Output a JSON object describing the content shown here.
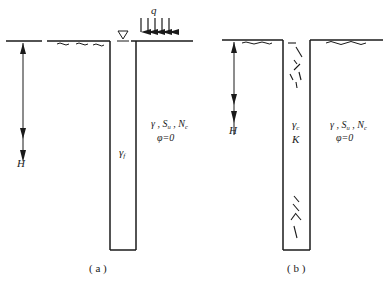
{
  "figure_a": {
    "caption": "( a )",
    "load_label": "q",
    "depth_label": "H",
    "fill_label": "γ_f",
    "fill_label_main": "γ",
    "fill_label_sub": "f",
    "soil_props": {
      "line1_main": "γ , S",
      "line1_sub1": "u",
      "line1_mid": " , N",
      "line1_sub2": "c",
      "line2": "φ=0"
    },
    "water_table_symbol": "▽"
  },
  "figure_b": {
    "caption": "( b )",
    "depth_label": "H",
    "fill_label_main": "γ",
    "fill_label_sub": "c",
    "fill_label_k": "K",
    "soil_props": {
      "line1_main": "γ , S",
      "line1_sub1": "u",
      "line1_mid": " , N",
      "line1_sub2": "c",
      "line2": "φ=0"
    }
  }
}
